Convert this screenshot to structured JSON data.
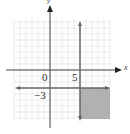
{
  "chart_data": {
    "type": "region",
    "title": "",
    "xlabel": "x",
    "ylabel": "y",
    "xlim": [
      -6,
      10
    ],
    "ylim": [
      -8,
      8
    ],
    "grid": true,
    "lines": [
      {
        "type": "vertical",
        "x": 5,
        "style": "solid",
        "arrows": "both"
      },
      {
        "type": "horizontal",
        "y": -3,
        "style": "solid",
        "arrows": "both"
      }
    ],
    "shaded_region": {
      "description": "x >= 5 and y <= -3",
      "color": "#a9a9a9"
    },
    "labels": [
      {
        "text": "0",
        "x": 0,
        "y": 0
      },
      {
        "text": "5",
        "x": 5,
        "y": 0
      },
      {
        "text": "-3",
        "x": 0,
        "y": -3
      }
    ]
  },
  "labels": {
    "origin": "0",
    "five": "5",
    "neg_three": "−3",
    "x_axis": "x",
    "y_axis": "y"
  }
}
